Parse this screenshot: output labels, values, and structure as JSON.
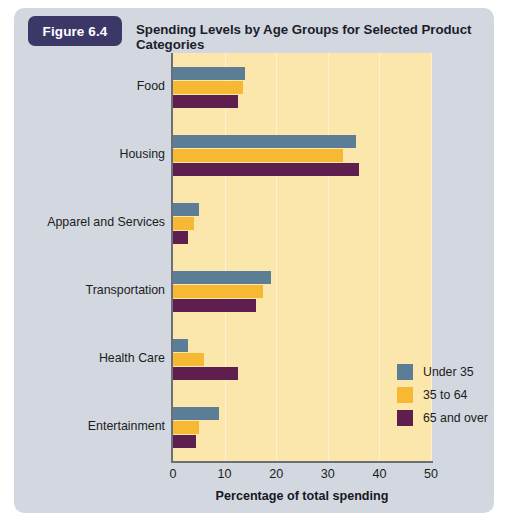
{
  "figure": {
    "badge_label": "Figure 6.4",
    "title": "Spending Levels by Age Groups for Selected Product Categories"
  },
  "colors": {
    "card_background": "#d3d8e0",
    "badge": "#3b3867",
    "plot_background": "#fbe6ab",
    "gridline": "#fdf3d4",
    "axis": "#6c6f78",
    "series_under35": "#5b7e96",
    "series_35to64": "#f7b833",
    "series_65over": "#5e1f4e"
  },
  "chart_data": {
    "type": "bar",
    "orientation": "horizontal",
    "title": "Spending Levels by Age Groups for Selected Product Categories",
    "xlabel": "Percentage of total spending",
    "ylabel": "",
    "xlim": [
      0,
      50
    ],
    "xticks": [
      0,
      10,
      20,
      30,
      40,
      50
    ],
    "grid": true,
    "legend_position": "inside-bottom-right",
    "categories": [
      "Food",
      "Housing",
      "Apparel and Services",
      "Transportation",
      "Health Care",
      "Entertainment"
    ],
    "series": [
      {
        "name": "Under 35",
        "color": "#5b7e96",
        "values": [
          14.0,
          35.5,
          5.0,
          19.0,
          3.0,
          9.0
        ]
      },
      {
        "name": "35 to 64",
        "color": "#f7b833",
        "values": [
          13.5,
          33.0,
          4.0,
          17.5,
          6.0,
          5.0
        ]
      },
      {
        "name": "65 and over",
        "color": "#5e1f4e",
        "values": [
          12.5,
          36.0,
          3.0,
          16.0,
          12.5,
          4.5
        ]
      }
    ]
  }
}
